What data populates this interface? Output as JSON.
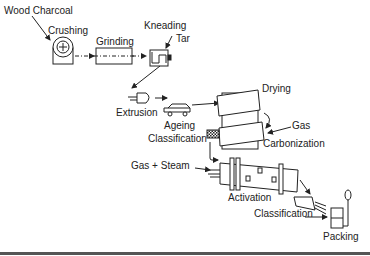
{
  "diagram": {
    "type": "process-flow",
    "nodes": [
      {
        "id": "wood_charcoal",
        "label": "Wood Charcoal"
      },
      {
        "id": "crushing",
        "label": "Crushing"
      },
      {
        "id": "grinding",
        "label": "Grinding"
      },
      {
        "id": "kneading",
        "label": "Kneading"
      },
      {
        "id": "tar",
        "label": "Tar"
      },
      {
        "id": "extrusion",
        "label": "Extrusion"
      },
      {
        "id": "ageing",
        "label": "Ageing"
      },
      {
        "id": "drying",
        "label": "Drying"
      },
      {
        "id": "gas",
        "label": "Gas"
      },
      {
        "id": "carbonization",
        "label": "Carbonization"
      },
      {
        "id": "classification1",
        "label": "Classification"
      },
      {
        "id": "gas_steam",
        "label": "Gas + Steam"
      },
      {
        "id": "activation",
        "label": "Activation"
      },
      {
        "id": "classification2",
        "label": "Classification"
      },
      {
        "id": "packing",
        "label": "Packing"
      }
    ],
    "edges": [
      [
        "wood_charcoal",
        "crushing"
      ],
      [
        "crushing",
        "grinding"
      ],
      [
        "grinding",
        "kneading"
      ],
      [
        "tar",
        "kneading"
      ],
      [
        "kneading",
        "extrusion"
      ],
      [
        "extrusion",
        "ageing"
      ],
      [
        "ageing",
        "drying"
      ],
      [
        "drying",
        "carbonization"
      ],
      [
        "gas",
        "carbonization"
      ],
      [
        "carbonization",
        "classification1"
      ],
      [
        "classification1",
        "activation"
      ],
      [
        "gas_steam",
        "activation"
      ],
      [
        "activation",
        "classification2"
      ],
      [
        "classification2",
        "packing"
      ]
    ]
  }
}
